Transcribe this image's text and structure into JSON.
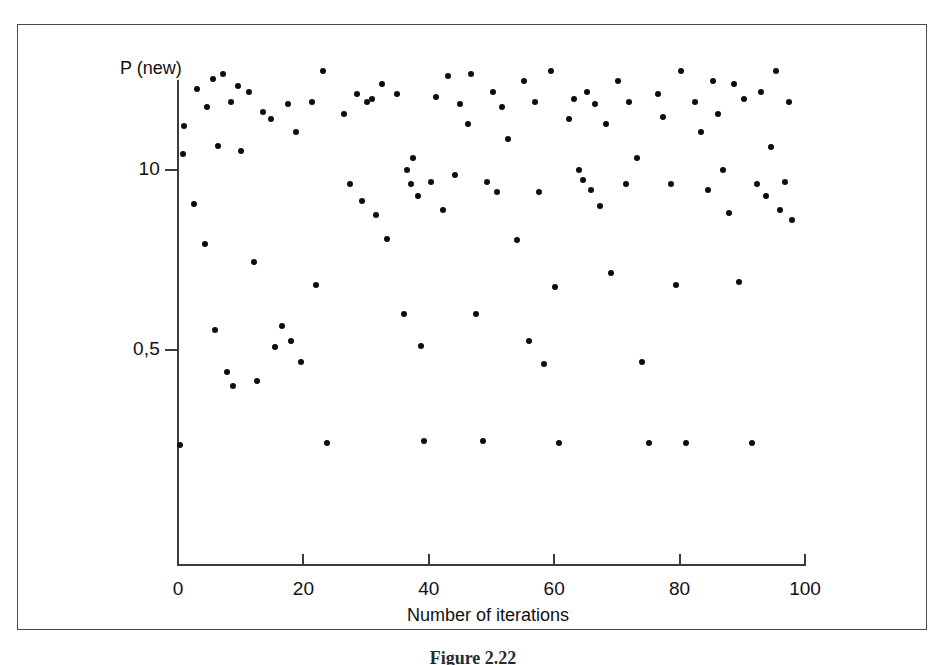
{
  "figure": {
    "caption": "Figure 2.22",
    "border_color": "#4a4a4a",
    "background": "#ffffff"
  },
  "axes": {
    "y_title": "P (new)",
    "x_title": "Number of iterations",
    "axis_color": "#3c3c3c",
    "point_color": "#0d0d0d"
  },
  "chart_data": {
    "type": "scatter",
    "title": "",
    "subtitle": "",
    "xlabel": "Number of iterations",
    "ylabel": "P (new)",
    "xlim": [
      0,
      100
    ],
    "ylim": [
      0,
      1.35
    ],
    "xticks": [
      0,
      20,
      40,
      60,
      80,
      100
    ],
    "xticklabels": [
      "0",
      "20",
      "40",
      "60",
      "80",
      "100"
    ],
    "yticks": [
      0.5,
      1.0
    ],
    "yticklabels": [
      "0,5",
      "10"
    ],
    "grid": false,
    "legend": null,
    "marker": "circle",
    "marker_size_px": 6,
    "series": [
      {
        "name": "P (new)",
        "color": "#0d0d0d",
        "points": [
          [
            0.3,
            0.236
          ],
          [
            0.8,
            1.045
          ],
          [
            1.0,
            1.122
          ],
          [
            2.6,
            0.905
          ],
          [
            3.0,
            1.225
          ],
          [
            4.3,
            0.795
          ],
          [
            4.6,
            1.176
          ],
          [
            5.6,
            1.253
          ],
          [
            5.9,
            0.555
          ],
          [
            6.4,
            1.066
          ],
          [
            7.1,
            1.268
          ],
          [
            7.8,
            0.44
          ],
          [
            8.5,
            1.19
          ],
          [
            8.8,
            0.4
          ],
          [
            9.5,
            1.232
          ],
          [
            10.1,
            1.053
          ],
          [
            11.4,
            1.218
          ],
          [
            12.2,
            0.745
          ],
          [
            12.6,
            0.415
          ],
          [
            13.5,
            1.162
          ],
          [
            14.9,
            1.141
          ],
          [
            15.4,
            0.509
          ],
          [
            16.6,
            0.566
          ],
          [
            17.5,
            1.183
          ],
          [
            18.0,
            0.524
          ],
          [
            18.8,
            1.106
          ],
          [
            19.6,
            0.466
          ],
          [
            21.3,
            1.19
          ],
          [
            22.0,
            0.68
          ],
          [
            23.2,
            1.274
          ],
          [
            23.8,
            0.243
          ],
          [
            26.4,
            1.155
          ],
          [
            27.5,
            0.96
          ],
          [
            28.6,
            1.211
          ],
          [
            29.4,
            0.915
          ],
          [
            30.1,
            1.19
          ],
          [
            31.0,
            1.197
          ],
          [
            31.6,
            0.875
          ],
          [
            32.5,
            1.239
          ],
          [
            33.3,
            0.809
          ],
          [
            35.0,
            1.211
          ],
          [
            36.0,
            0.6
          ],
          [
            36.6,
            1.0
          ],
          [
            37.2,
            0.96
          ],
          [
            37.5,
            1.034
          ],
          [
            38.3,
            0.929
          ],
          [
            38.8,
            0.511
          ],
          [
            39.3,
            0.247
          ],
          [
            40.4,
            0.966
          ],
          [
            41.2,
            1.204
          ],
          [
            42.2,
            0.89
          ],
          [
            43.0,
            1.26
          ],
          [
            44.2,
            0.987
          ],
          [
            45.0,
            1.183
          ],
          [
            46.2,
            1.127
          ],
          [
            46.8,
            1.268
          ],
          [
            47.5,
            0.6
          ],
          [
            48.6,
            0.247
          ],
          [
            49.3,
            0.966
          ],
          [
            50.2,
            1.218
          ],
          [
            50.8,
            0.938
          ],
          [
            51.6,
            1.176
          ],
          [
            52.7,
            1.085
          ],
          [
            54.1,
            0.806
          ],
          [
            55.2,
            1.246
          ],
          [
            56.0,
            0.526
          ],
          [
            57.0,
            1.19
          ],
          [
            57.6,
            0.938
          ],
          [
            58.4,
            0.462
          ],
          [
            59.5,
            1.274
          ],
          [
            60.2,
            0.675
          ],
          [
            60.8,
            0.243
          ],
          [
            62.3,
            1.141
          ],
          [
            63.2,
            1.197
          ],
          [
            64.0,
            1.0
          ],
          [
            64.6,
            0.972
          ],
          [
            65.2,
            1.218
          ],
          [
            65.8,
            0.945
          ],
          [
            66.5,
            1.183
          ],
          [
            67.3,
            0.899
          ],
          [
            68.2,
            1.127
          ],
          [
            69.0,
            0.715
          ],
          [
            70.2,
            1.246
          ],
          [
            71.4,
            0.96
          ],
          [
            72.0,
            1.19
          ],
          [
            73.2,
            1.034
          ],
          [
            74.0,
            0.466
          ],
          [
            75.1,
            0.243
          ],
          [
            76.5,
            1.211
          ],
          [
            77.4,
            1.148
          ],
          [
            78.6,
            0.96
          ],
          [
            79.4,
            0.68
          ],
          [
            80.2,
            1.274
          ],
          [
            81.0,
            0.243
          ],
          [
            82.5,
            1.19
          ],
          [
            83.4,
            1.106
          ],
          [
            84.6,
            0.945
          ],
          [
            85.4,
            1.246
          ],
          [
            86.2,
            1.155
          ],
          [
            87.0,
            1.0
          ],
          [
            87.8,
            0.88
          ],
          [
            88.6,
            1.239
          ],
          [
            89.5,
            0.69
          ],
          [
            90.3,
            1.197
          ],
          [
            91.6,
            0.243
          ],
          [
            92.4,
            0.96
          ],
          [
            93.0,
            1.218
          ],
          [
            93.8,
            0.929
          ],
          [
            94.6,
            1.064
          ],
          [
            95.4,
            1.274
          ],
          [
            96.0,
            0.89
          ],
          [
            96.8,
            0.966
          ],
          [
            97.4,
            1.19
          ],
          [
            98.0,
            0.86
          ]
        ]
      }
    ]
  }
}
